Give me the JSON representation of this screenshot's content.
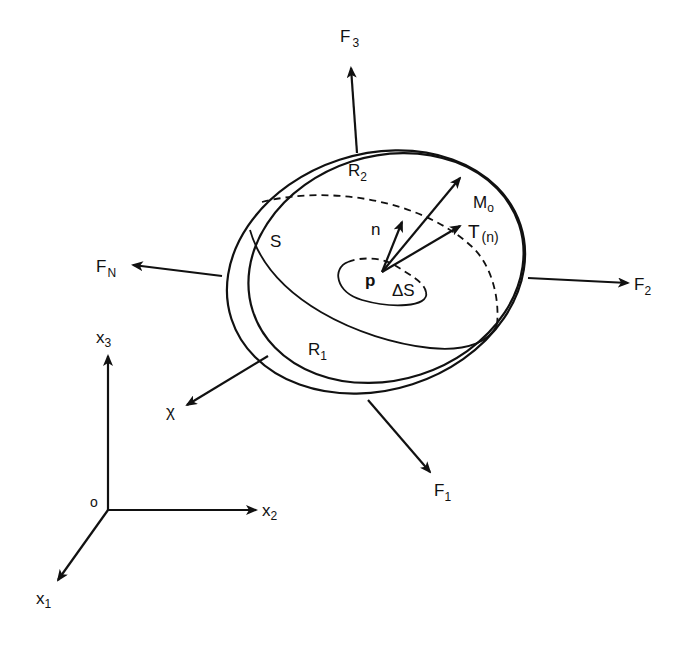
{
  "figure": {
    "type": "continuum-body-free-body-diagram",
    "body_labels": {
      "region_upper": {
        "base": "R",
        "sub": "2"
      },
      "region_lower": {
        "base": "R",
        "sub": "1"
      },
      "surface": "S",
      "point": "p",
      "area_element": "ΔS",
      "normal": "n",
      "traction": {
        "base": "T",
        "sub": "(n)"
      },
      "moment": {
        "base": "M",
        "sub": "o"
      },
      "body_force": "χ"
    },
    "forces": [
      {
        "base": "F",
        "sub": "1"
      },
      {
        "base": "F",
        "sub": "2"
      },
      {
        "base": "F",
        "sub": "3"
      },
      {
        "base": "F",
        "sub": "N"
      }
    ],
    "axes": {
      "origin": "o",
      "x1": {
        "base": "x",
        "sub": "1"
      },
      "x2": {
        "base": "x",
        "sub": "2"
      },
      "x3": {
        "base": "x",
        "sub": "3"
      }
    }
  }
}
